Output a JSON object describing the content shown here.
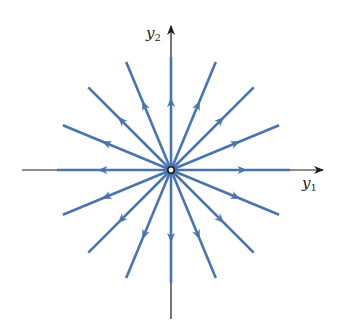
{
  "figure": {
    "type": "phase-portrait",
    "center": [
      171,
      170
    ],
    "ray_color": "#4a74ad",
    "axis_color": "#1a1a1a",
    "origin_marker": "open-circle"
  },
  "axes": {
    "x": {
      "label": "y",
      "subscript": "1"
    },
    "y": {
      "label": "y",
      "subscript": "2"
    }
  },
  "rays": {
    "count": 16,
    "angles_deg": [
      0,
      22.5,
      45,
      67.5,
      90,
      112.5,
      135,
      157.5,
      180,
      202.5,
      225,
      247.5,
      270,
      292.5,
      315,
      337.5
    ],
    "direction": "outward"
  }
}
